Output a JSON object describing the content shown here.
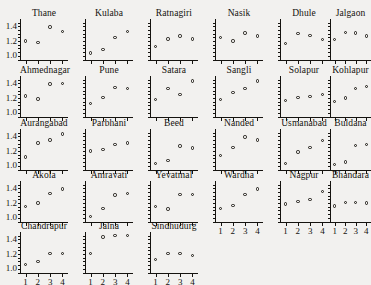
{
  "figure": {
    "type": "trellis-scatter-panels",
    "rows": 5,
    "columns": 6,
    "panel_count": 27,
    "marker": "open-circle"
  },
  "axes": {
    "y_ticks": [
      "1.0",
      "1.2",
      "1.4"
    ],
    "y_tick_values": [
      1.0,
      1.2,
      1.4
    ],
    "y_minor_count": 9,
    "ylim": [
      0.93,
      1.5
    ],
    "x_ticks": [
      "1",
      "2",
      "3",
      "4"
    ],
    "x_tick_values": [
      1,
      2,
      3,
      4
    ],
    "xlim": [
      0.55,
      4.45
    ],
    "xlabel": "",
    "ylabel": "",
    "grid": false
  },
  "chart_data": {
    "type": "scatter",
    "title": "",
    "subtitle": "",
    "xlabel": "",
    "ylabel": "",
    "x": [
      1,
      2,
      3,
      4
    ],
    "xlim": [
      0.55,
      4.45
    ],
    "ylim": [
      0.93,
      1.5
    ],
    "x_tick_labels": [
      "1",
      "2",
      "3",
      "4"
    ],
    "y_tick_labels": [
      "1.0",
      "1.2",
      "1.4"
    ],
    "legend": [],
    "grid": false,
    "panel_layout": "5 rows x 6 columns, 27 panels, shared axes",
    "panels": [
      {
        "name": "Thane",
        "row": 0,
        "col": 0,
        "values": [
          1.2,
          1.18,
          1.39,
          1.33
        ]
      },
      {
        "name": "Kulaba",
        "row": 0,
        "col": 1,
        "values": [
          1.04,
          1.09,
          1.25,
          1.33
        ]
      },
      {
        "name": "Ratnagiri",
        "row": 0,
        "col": 2,
        "values": [
          1.13,
          1.23,
          1.27,
          1.23
        ]
      },
      {
        "name": "Nasik",
        "row": 0,
        "col": 3,
        "values": [
          1.25,
          1.2,
          1.31,
          1.27
        ]
      },
      {
        "name": "Dhule",
        "row": 0,
        "col": 4,
        "values": [
          1.17,
          1.3,
          1.28,
          1.22
        ]
      },
      {
        "name": "Jalgaon",
        "row": 0,
        "col": 5,
        "values": [
          1.22,
          1.32,
          1.31,
          1.27
        ]
      },
      {
        "name": "Ahmednagar",
        "row": 1,
        "col": 0,
        "values": [
          1.23,
          1.19,
          1.39,
          1.4
        ]
      },
      {
        "name": "Pune",
        "row": 1,
        "col": 1,
        "values": [
          1.13,
          1.21,
          1.34,
          1.33
        ]
      },
      {
        "name": "Satara",
        "row": 1,
        "col": 2,
        "values": [
          1.18,
          1.33,
          1.25,
          1.43
        ]
      },
      {
        "name": "Sangli",
        "row": 1,
        "col": 3,
        "values": [
          1.18,
          1.28,
          1.33,
          1.43
        ]
      },
      {
        "name": "Solapur",
        "row": 1,
        "col": 4,
        "values": [
          1.17,
          1.21,
          1.22,
          1.25
        ]
      },
      {
        "name": "Kohlapur",
        "row": 1,
        "col": 5,
        "values": [
          1.15,
          1.2,
          1.33,
          1.36
        ]
      },
      {
        "name": "Aurangabad",
        "row": 2,
        "col": 0,
        "values": [
          1.12,
          1.31,
          1.35,
          1.43
        ]
      },
      {
        "name": "Parbhani",
        "row": 2,
        "col": 1,
        "values": [
          1.2,
          1.22,
          1.29,
          1.31
        ]
      },
      {
        "name": "Beed",
        "row": 2,
        "col": 2,
        "values": [
          1.03,
          1.07,
          1.27,
          1.24
        ]
      },
      {
        "name": "Nanded",
        "row": 2,
        "col": 3,
        "values": [
          1.14,
          1.25,
          1.39,
          1.35
        ]
      },
      {
        "name": "Usmanabad",
        "row": 2,
        "col": 4,
        "values": [
          1.03,
          1.19,
          1.25,
          1.34
        ]
      },
      {
        "name": "Buldana",
        "row": 2,
        "col": 5,
        "values": [
          1.02,
          1.05,
          1.28,
          1.29
        ]
      },
      {
        "name": "Akola",
        "row": 3,
        "col": 0,
        "values": [
          1.15,
          1.2,
          1.33,
          1.39
        ]
      },
      {
        "name": "Amravati",
        "row": 3,
        "col": 1,
        "values": [
          1.02,
          1.13,
          1.31,
          1.33
        ]
      },
      {
        "name": "Yevatmal",
        "row": 3,
        "col": 2,
        "values": [
          1.15,
          1.12,
          1.32,
          1.32
        ]
      },
      {
        "name": "Wardha",
        "row": 3,
        "col": 3,
        "values": [
          1.13,
          1.17,
          1.32,
          1.39
        ]
      },
      {
        "name": "Nagpur",
        "row": 3,
        "col": 4,
        "values": [
          1.19,
          1.22,
          1.25,
          1.36
        ]
      },
      {
        "name": "Bhandara",
        "row": 3,
        "col": 5,
        "values": [
          1.16,
          1.21,
          1.21,
          1.2
        ]
      },
      {
        "name": "Chandrapur",
        "row": 4,
        "col": 0,
        "values": [
          1.06,
          1.1,
          1.21,
          1.21
        ]
      },
      {
        "name": "Jalna",
        "row": 4,
        "col": 1,
        "values": [
          1.21,
          1.43,
          1.45,
          1.45
        ]
      },
      {
        "name": "Sindhudurg",
        "row": 4,
        "col": 2,
        "values": [
          1.13,
          1.21,
          1.21,
          1.18
        ]
      }
    ]
  }
}
